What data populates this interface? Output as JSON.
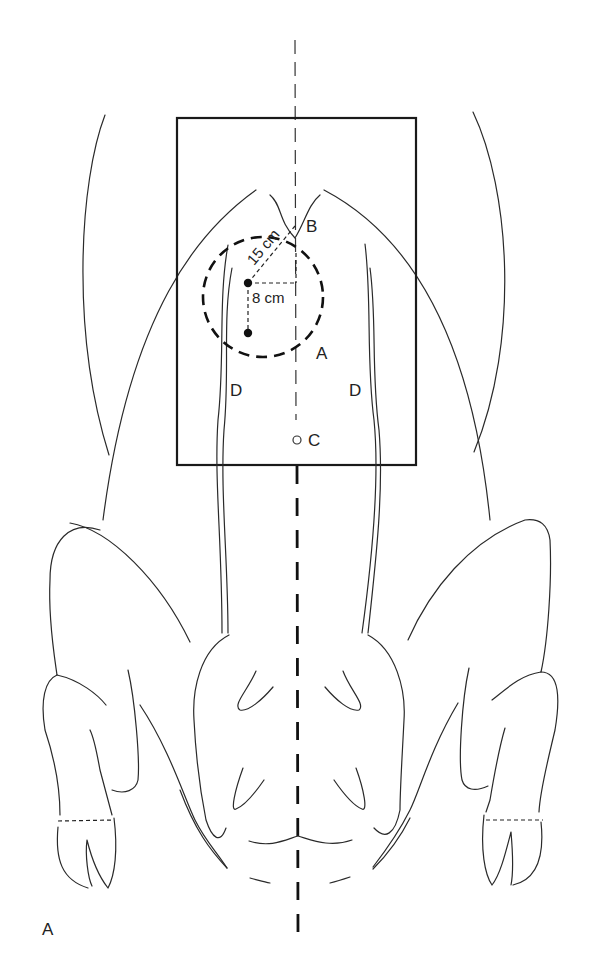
{
  "figure": {
    "panel_label": "A",
    "labels": {
      "point_a": "A",
      "point_b": "B",
      "point_c": "C",
      "region_d_left": "D",
      "region_d_right": "D"
    },
    "measurements": {
      "diagonal": "15 cm",
      "vertical": "8 cm"
    },
    "elements": {
      "field_rectangle": "rectangular field outline",
      "target_circle": "dashed circle A",
      "midline": "dashed ventral midline"
    },
    "colors": {
      "stroke": "#222222",
      "background": "#ffffff"
    }
  }
}
